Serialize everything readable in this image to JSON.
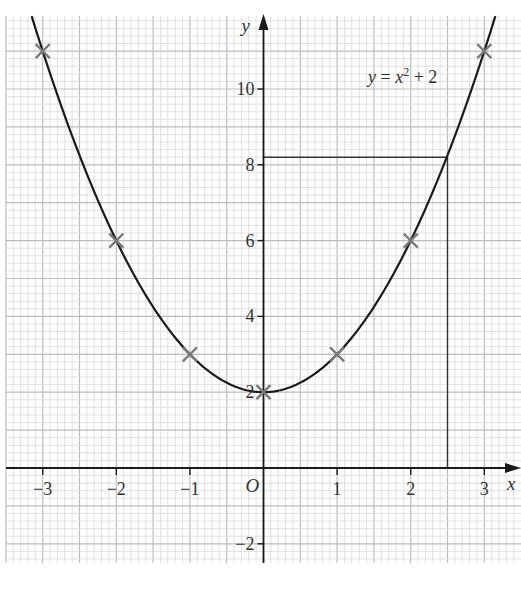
{
  "chart_data": {
    "type": "line",
    "title": "",
    "equation_label": "y = x² + 2",
    "xlabel": "x",
    "ylabel": "y",
    "origin_label": "O",
    "xlim": [
      -3.5,
      3.5
    ],
    "ylim": [
      -3.3,
      11.9
    ],
    "grid": true,
    "x_ticks": [
      -3,
      -2,
      -1,
      1,
      2,
      3
    ],
    "x_tick_labels": [
      "−3",
      "−2",
      "−1",
      "1",
      "2",
      "3"
    ],
    "y_ticks": [
      -2,
      2,
      4,
      6,
      8,
      10
    ],
    "y_tick_labels": [
      "−2",
      "2",
      "4",
      "6",
      "8",
      "10"
    ],
    "series": [
      {
        "name": "y = x² + 2",
        "function": "x^2 + 2",
        "x": [
          -3,
          -2,
          -1,
          0,
          1,
          2,
          3
        ],
        "y": [
          11,
          6,
          3,
          2,
          3,
          6,
          11
        ]
      }
    ],
    "plotted_points": [
      {
        "x": -3,
        "y": 11
      },
      {
        "x": -2,
        "y": 6
      },
      {
        "x": -1,
        "y": 3
      },
      {
        "x": 0,
        "y": 2
      },
      {
        "x": 1,
        "y": 3
      },
      {
        "x": 2,
        "y": 6
      },
      {
        "x": 3,
        "y": 11
      }
    ],
    "annotations": [
      {
        "type": "reading-line",
        "from": {
          "x": 0,
          "y": 8.2
        },
        "corner": {
          "x": 2.5,
          "y": 8.2
        },
        "to": {
          "x": 2.5,
          "y": 0
        }
      }
    ]
  },
  "colors": {
    "curve": "#1a1a1a",
    "axis": "#1a1a1a",
    "grid_minor": "#d9d9d9",
    "grid_major": "#bdbdbd",
    "marker": "#7a7a7a",
    "text": "#333333"
  }
}
